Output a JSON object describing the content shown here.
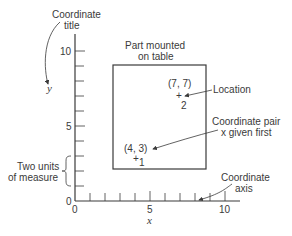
{
  "diagram": {
    "labels": {
      "coordinate_title": [
        "Coordinate",
        "title"
      ],
      "part_mounted": [
        "Part mounted",
        "on table"
      ],
      "location": "Location",
      "coordinate_pair": [
        "Coordinate pair",
        "x given first"
      ],
      "two_units": [
        "Two units",
        "of measure"
      ],
      "coordinate_axis": [
        "Coordinate",
        "axis"
      ],
      "x_axis_title": "x",
      "y_axis_title": "y"
    },
    "x_ticks": [
      "0",
      "5",
      "10"
    ],
    "y_ticks": [
      "0",
      "5",
      "10"
    ],
    "points": [
      {
        "label": "(4, 3)",
        "number": "1",
        "x": 4,
        "y": 3
      },
      {
        "label": "(7, 7)",
        "number": "2",
        "x": 7,
        "y": 7
      }
    ],
    "rectangle": {
      "x_min": 2.5,
      "x_max": 8.8,
      "y_min": 2.1,
      "y_max": 9.1
    },
    "colors": {
      "line": "#3a3a3a",
      "background": "#ffffff"
    }
  }
}
